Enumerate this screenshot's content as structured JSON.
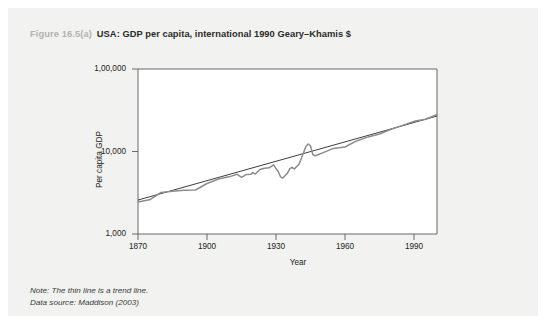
{
  "caption": {
    "figure_number": "Figure 16.5(a)",
    "title": "USA: GDP per capita, international 1990 Geary–Khamis $"
  },
  "notes": {
    "note": "Note: The thin line is a trend line.",
    "source": "Data source: Maddison (2003)"
  },
  "colors": {
    "card_background": "#f2f2f0",
    "page_background": "#ffffff",
    "figure_number": "#b3b3b3",
    "caption_title": "#2a2a2a",
    "axis": "#5a5a5a",
    "series_line": "#8c8c8c",
    "trend_line": "#1a1a1a",
    "tick_text": "#222222"
  },
  "chart_data": {
    "type": "line",
    "title": "USA: GDP per capita, international 1990 Geary–Khamis $",
    "xlabel": "Year",
    "ylabel": "Per capita GDP",
    "xlim": [
      1870,
      2000
    ],
    "ylim": [
      1000,
      100000
    ],
    "yscale": "log",
    "grid": false,
    "legend": "none",
    "xticks": [
      1870,
      1900,
      1930,
      1960,
      1990
    ],
    "xtick_labels": [
      "1870",
      "1900",
      "1930",
      "1960",
      "1990"
    ],
    "yticks": [
      1000,
      10000,
      100000
    ],
    "ytick_labels": [
      "1,000",
      "10,000",
      "1,00,000"
    ],
    "annotations": [
      "Great Depression trough around 1932–1933",
      "World War II output peak around 1944",
      "Thin straight line is an exponential trend line"
    ],
    "series": [
      {
        "name": "GDP per capita",
        "style": "thick-gray",
        "x": [
          1870,
          1875,
          1880,
          1885,
          1890,
          1895,
          1900,
          1905,
          1910,
          1913,
          1915,
          1917,
          1919,
          1920,
          1921,
          1923,
          1925,
          1927,
          1929,
          1930,
          1931,
          1932,
          1933,
          1934,
          1935,
          1936,
          1937,
          1938,
          1939,
          1940,
          1941,
          1942,
          1943,
          1944,
          1945,
          1946,
          1947,
          1948,
          1950,
          1955,
          1960,
          1965,
          1970,
          1975,
          1980,
          1985,
          1990,
          1995,
          2000
        ],
        "y": [
          2445,
          2600,
          3184,
          3300,
          3392,
          3414,
          4091,
          4642,
          4964,
          5301,
          4864,
          5248,
          5283,
          5552,
          5323,
          6045,
          6282,
          6340,
          6899,
          6213,
          5691,
          4908,
          4777,
          5114,
          5467,
          6204,
          6430,
          6126,
          6561,
          7010,
          8206,
          9741,
          11518,
          12333,
          11709,
          9197,
          8886,
          9065,
          9561,
          10897,
          11328,
          13419,
          15030,
          16284,
          18577,
          20717,
          23201,
          24605,
          28129
        ]
      },
      {
        "name": "Trend line",
        "style": "thin-black",
        "x": [
          1870,
          2000
        ],
        "y": [
          2580,
          26900
        ]
      }
    ]
  }
}
